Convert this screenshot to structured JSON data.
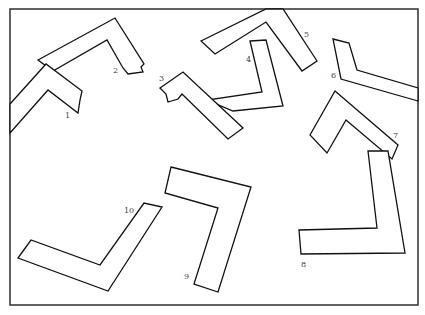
{
  "figure": {
    "frame": {
      "x": 10,
      "y": 9,
      "width": 408,
      "height": 296,
      "stroke": "#3a3a3a"
    },
    "stroke_color": "#111111",
    "label_color": "#444444",
    "shapes": [
      {
        "id": "2",
        "label": "2",
        "label_x": 113,
        "label_y": 73,
        "points": "38,60 115,18 144,64 141,67 143,72 128,74 123,68 107,40 53,71"
      },
      {
        "id": "1",
        "label": "1",
        "label_x": 65,
        "label_y": 118,
        "points": "10,104 46,64 82,91 80,100 78,113 48,90 10,133"
      },
      {
        "id": "5",
        "label": "5",
        "label_x": 304,
        "label_y": 37,
        "points": "201,41 266,9 283,9 317,61 302,71 266,22 215,54"
      },
      {
        "id": "4",
        "label": "4",
        "label_x": 246,
        "label_y": 62,
        "points": "250,41 266,40 283,106 233,111 207,100 262,92"
      },
      {
        "id": "3",
        "label": "3",
        "label_x": 159,
        "label_y": 81,
        "points": "160,88 183,72 243,128 228,139 182,94 178,99 168,102 166,94"
      },
      {
        "id": "6",
        "label": "6",
        "label_x": 331,
        "label_y": 78,
        "points": "333,39 349,43 357,70 418,88 418,101 341,79"
      },
      {
        "id": "7",
        "label": "7",
        "label_x": 393,
        "label_y": 138,
        "points": "310,135 335,91 398,145 392,159 346,120 327,153"
      },
      {
        "id": "8",
        "label": "8",
        "label_x": 301,
        "label_y": 267,
        "points": "368,151 388,151 405,253 301,254 299,230 377,228"
      },
      {
        "id": "9",
        "label": "9",
        "label_x": 184,
        "label_y": 279,
        "points": "171,167 251,187 218,292 194,284 218,208 165,193"
      },
      {
        "id": "10",
        "label": "10",
        "label_x": 124,
        "label_y": 213,
        "points": "18,258 31,240 100,265 144,203 162,207 108,291"
      }
    ]
  }
}
